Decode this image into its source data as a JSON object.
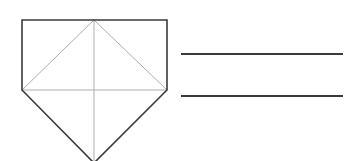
{
  "canvas": {
    "width": 354,
    "height": 161,
    "background": "#ffffff"
  },
  "palette": {
    "outline_dark": "#3a3a3a",
    "construction_light": "#adadad",
    "rule_dark": "#3a3a3a",
    "background": "#ffffff"
  },
  "strokes": {
    "outline_width": 1.6,
    "construction_width": 1.0,
    "rule_width": 1.8
  },
  "figures": [
    {
      "id": "pentagon-figure",
      "name": "home-plate-pentagon",
      "description": "Pentagon formed by a square with a triangle below, with interior construction lines",
      "vertices": {
        "top_left": [
          22,
          20
        ],
        "top_right": [
          167,
          20
        ],
        "mid_right": [
          167,
          90
        ],
        "bottom_apex": [
          94,
          163
        ],
        "mid_left": [
          22,
          90
        ],
        "top_mid": [
          94,
          20
        ]
      },
      "outline_path": "M 22 20 L 167 20 L 167 90 L 94 163 L 22 90 Z",
      "construction_lines": [
        {
          "name": "square-base-line",
          "from": [
            22,
            90
          ],
          "to": [
            167,
            90
          ]
        },
        {
          "name": "diagonal-left",
          "from": [
            94,
            20
          ],
          "to": [
            22,
            90
          ]
        },
        {
          "name": "diagonal-right",
          "from": [
            94,
            20
          ],
          "to": [
            167,
            90
          ]
        },
        {
          "name": "vertical-axis",
          "from": [
            94,
            20
          ],
          "to": [
            94,
            163
          ]
        }
      ]
    },
    {
      "id": "rules-figure",
      "name": "parallel-horizontal-rules",
      "description": "Two parallel horizontal line segments",
      "lines": [
        {
          "name": "rule-top",
          "from": [
            181,
            54
          ],
          "to": [
            343,
            54
          ]
        },
        {
          "name": "rule-bottom",
          "from": [
            181,
            96
          ],
          "to": [
            343,
            96
          ]
        }
      ]
    }
  ]
}
